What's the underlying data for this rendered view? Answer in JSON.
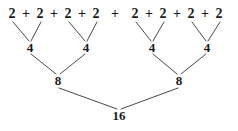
{
  "figure": {
    "kind": "binary-addition-tree",
    "background_color": "#ffffff",
    "text_color": "#1a1a1a",
    "line_color": "#4a4a4a",
    "line_width": 1,
    "width": 238,
    "height": 131
  },
  "chart_data": {
    "type": "diagram",
    "title": "",
    "levels": [
      {
        "name": "leaves",
        "y": 14,
        "values": [
          "2",
          "2",
          "2",
          "2",
          "2",
          "2",
          "2",
          "2"
        ],
        "x": [
          12,
          40,
          68,
          96,
          135,
          163,
          191,
          219
        ]
      },
      {
        "name": "operators",
        "y": 14,
        "values": [
          "+",
          "+",
          "+",
          "+",
          "+",
          "+",
          "+"
        ],
        "x": [
          26,
          54,
          82,
          115,
          149,
          177,
          205
        ]
      },
      {
        "name": "level-1",
        "y": 47,
        "values": [
          "4",
          "4",
          "4",
          "4"
        ],
        "x": [
          30,
          86,
          152,
          207
        ]
      },
      {
        "name": "level-2",
        "y": 80,
        "values": [
          "8",
          "8"
        ],
        "x": [
          58,
          179
        ]
      },
      {
        "name": "root",
        "y": 115,
        "values": [
          "16"
        ],
        "x": [
          119
        ]
      }
    ],
    "edges": [
      {
        "x1": 13,
        "y1": 22,
        "x2": 29,
        "y2": 41
      },
      {
        "x1": 41,
        "y1": 22,
        "x2": 31,
        "y2": 41
      },
      {
        "x1": 69,
        "y1": 22,
        "x2": 85,
        "y2": 41
      },
      {
        "x1": 97,
        "y1": 22,
        "x2": 87,
        "y2": 41
      },
      {
        "x1": 136,
        "y1": 22,
        "x2": 151,
        "y2": 41
      },
      {
        "x1": 164,
        "y1": 22,
        "x2": 153,
        "y2": 41
      },
      {
        "x1": 192,
        "y1": 22,
        "x2": 206,
        "y2": 41
      },
      {
        "x1": 220,
        "y1": 22,
        "x2": 208,
        "y2": 41
      },
      {
        "x1": 31,
        "y1": 54,
        "x2": 56,
        "y2": 74
      },
      {
        "x1": 85,
        "y1": 54,
        "x2": 60,
        "y2": 74
      },
      {
        "x1": 153,
        "y1": 54,
        "x2": 177,
        "y2": 74
      },
      {
        "x1": 206,
        "y1": 54,
        "x2": 181,
        "y2": 74
      },
      {
        "x1": 59,
        "y1": 88,
        "x2": 117,
        "y2": 109
      },
      {
        "x1": 178,
        "y1": 88,
        "x2": 121,
        "y2": 109
      }
    ]
  },
  "nodes": {
    "leaf_0": "2",
    "leaf_1": "2",
    "leaf_2": "2",
    "leaf_3": "2",
    "leaf_4": "2",
    "leaf_5": "2",
    "leaf_6": "2",
    "leaf_7": "2",
    "op_0": "+",
    "op_1": "+",
    "op_2": "+",
    "op_3": "+",
    "op_4": "+",
    "op_5": "+",
    "op_6": "+",
    "sum_4_0": "4",
    "sum_4_1": "4",
    "sum_4_2": "4",
    "sum_4_3": "4",
    "sum_8_0": "8",
    "sum_8_1": "8",
    "total": "16"
  }
}
